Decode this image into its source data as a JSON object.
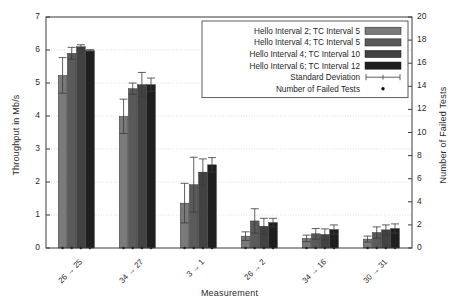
{
  "chart_data": {
    "type": "bar",
    "title": "",
    "xlabel": "Measurement",
    "ylabel": "Throughput in Mb/s",
    "ylabel_right": "Number of Failed Tests",
    "categories": [
      "26 → 25",
      "34 → 27",
      "3 → 1",
      "26 → 2",
      "34 → 16",
      "30 → 31"
    ],
    "ylim": [
      0,
      7
    ],
    "ylim_right": [
      0,
      20
    ],
    "yticks": [
      "0",
      "1",
      "2",
      "3",
      "4",
      "5",
      "6",
      "7"
    ],
    "yticks_right": [
      "0",
      "2",
      "4",
      "6",
      "8",
      "10",
      "12",
      "14",
      "16",
      "18",
      "20"
    ],
    "grid": true,
    "legend_position": "top-right",
    "series": [
      {
        "name": "Hello Interval 2; TC Interval 5",
        "color": "#7a7a7a",
        "values": [
          5.23,
          3.99,
          1.36,
          0.36,
          0.29,
          0.27
        ],
        "errors": [
          0.54,
          0.52,
          0.6,
          0.13,
          0.1,
          0.09
        ],
        "failed_tests": [
          0,
          0,
          0,
          0,
          0,
          0
        ]
      },
      {
        "name": "Hello Interval 4; TC Interval 5",
        "color": "#5a5a5a",
        "values": [
          5.9,
          4.83,
          1.92,
          0.82,
          0.43,
          0.47
        ],
        "errors": [
          0.18,
          0.17,
          0.83,
          0.37,
          0.16,
          0.17
        ],
        "failed_tests": [
          0,
          0,
          0,
          0,
          0,
          0
        ]
      },
      {
        "name": "Hello Interval 4; TC Interval 10",
        "color": "#424242",
        "values": [
          6.1,
          4.95,
          2.3,
          0.66,
          0.41,
          0.55
        ],
        "errors": [
          0.06,
          0.37,
          0.4,
          0.24,
          0.17,
          0.15
        ],
        "failed_tests": [
          0,
          0,
          0,
          0,
          0,
          0
        ]
      },
      {
        "name": "Hello Interval 6; TC Interval 12",
        "color": "#1f1f1f",
        "values": [
          5.98,
          4.95,
          2.52,
          0.77,
          0.56,
          0.59
        ],
        "errors": [
          0.03,
          0.2,
          0.22,
          0.13,
          0.14,
          0.14
        ],
        "failed_tests": [
          0,
          0,
          0,
          0,
          0,
          0
        ]
      }
    ],
    "legend_extra": [
      {
        "name": "Standard Deviation",
        "marker": "errorbar"
      },
      {
        "name": "Number of Failed Tests",
        "marker": "dot"
      }
    ]
  }
}
